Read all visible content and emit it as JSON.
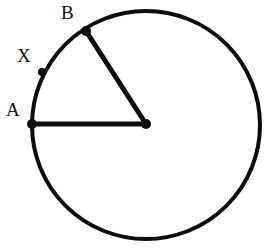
{
  "figure": {
    "background_color": "#ffffff",
    "stroke_color": "#0d0d0d",
    "width": 265,
    "height": 250
  },
  "chart_data": {
    "type": "diagram",
    "subtype": "euclidean-circle-geometry",
    "xlabel": "",
    "ylabel": "",
    "grid": false,
    "legend": null,
    "units": "pixels",
    "coordinate_system": "screen (y increases downward)",
    "circle": {
      "name": "circle",
      "center_x": 146,
      "center_y": 125,
      "radius": 114,
      "stroke_width": 4,
      "stroke_color": "#0d0d0d",
      "fill": "none"
    },
    "points": [
      {
        "id": "O",
        "label": "",
        "x": 146,
        "y": 124,
        "marker": "filled-dot",
        "marker_radius": 5,
        "on_circle": false,
        "role": "center"
      },
      {
        "id": "A",
        "label": "A",
        "x": 32,
        "y": 124,
        "marker": "filled-dot",
        "marker_radius": 5,
        "on_circle": true,
        "angle_degrees": 180,
        "role": "endpoint-of-radius",
        "label_x": 6,
        "label_y": 100
      },
      {
        "id": "X",
        "label": "X",
        "x": 42,
        "y": 72,
        "marker": "filled-dot",
        "marker_radius": 4,
        "on_circle": true,
        "angle_degrees": 152,
        "role": "point-on-arc-AB",
        "label_x": 17,
        "label_y": 46
      },
      {
        "id": "B",
        "label": "B",
        "x": 86,
        "y": 31,
        "marker": "filled-dot",
        "marker_radius": 5,
        "on_circle": true,
        "angle_degrees": 123,
        "role": "endpoint-of-radius",
        "label_x": 61,
        "label_y": 3
      }
    ],
    "segments": [
      {
        "id": "OA",
        "from": "O",
        "to": "A",
        "x1": 146,
        "y1": 124,
        "x2": 32,
        "y2": 124,
        "stroke_width": 5,
        "stroke_color": "#0d0d0d",
        "kind": "radius"
      },
      {
        "id": "OB",
        "from": "O",
        "to": "B",
        "x1": 146,
        "y1": 124,
        "x2": 86,
        "y2": 31,
        "stroke_width": 5,
        "stroke_color": "#0d0d0d",
        "kind": "radius"
      }
    ],
    "arcs": [
      {
        "id": "arc-AXB",
        "from": "A",
        "through": "X",
        "to": "B",
        "start_angle_degrees": 180,
        "end_angle_degrees": 123,
        "note": "minor arc from A to B containing X"
      }
    ],
    "labels": [
      {
        "id": "label-A",
        "text": "A",
        "x": 6,
        "y": 100
      },
      {
        "id": "label-X",
        "text": "X",
        "x": 17,
        "y": 46
      },
      {
        "id": "label-B",
        "text": "B",
        "x": 61,
        "y": 3
      }
    ]
  }
}
